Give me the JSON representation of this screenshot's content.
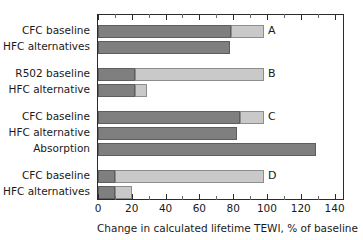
{
  "chart_data": {
    "type": "bar",
    "orientation": "horizontal",
    "title": "",
    "xlabel": "Change in calculated lifetime TEWI, % of baseline",
    "ylabel": "",
    "xlim": [
      0,
      145
    ],
    "xticks": [
      0,
      20,
      40,
      60,
      80,
      100,
      120,
      140
    ],
    "xtick_labels": [
      "0",
      "20",
      "40",
      "60",
      "80",
      "100",
      "120",
      "140"
    ],
    "minor_tick_step": 10,
    "grid": false,
    "legend": null,
    "stacked": true,
    "segment_names": [
      "direct",
      "indirect"
    ],
    "segment_colors": [
      "#7f7f7f",
      "#c9c9c9"
    ],
    "panels": [
      {
        "letter": "A",
        "bars": [
          {
            "label": "CFC baseline",
            "values": [
              79,
              19
            ],
            "total": 98
          },
          {
            "label": "HFC alternatives",
            "values": [
              78,
              0
            ],
            "total": 78
          }
        ]
      },
      {
        "letter": "B",
        "bars": [
          {
            "label": "R502 baseline",
            "values": [
              22,
              76
            ],
            "total": 98
          },
          {
            "label": "HFC alternative",
            "values": [
              22,
              7
            ],
            "total": 29
          }
        ]
      },
      {
        "letter": "C",
        "bars": [
          {
            "label": "CFC baseline",
            "values": [
              84,
              14
            ],
            "total": 98
          },
          {
            "label": "HFC alternative",
            "values": [
              82,
              0
            ],
            "total": 82
          },
          {
            "label": "Absorption",
            "values": [
              129,
              0
            ],
            "total": 129
          }
        ]
      },
      {
        "letter": "D",
        "bars": [
          {
            "label": "CFC baseline",
            "values": [
              10,
              88
            ],
            "total": 98
          },
          {
            "label": "HFC alternatives",
            "values": [
              10,
              10
            ],
            "total": 20
          }
        ]
      }
    ]
  },
  "axis": {
    "title": "Change in calculated lifetime TEWI, % of baseline",
    "tick_labels": [
      "0",
      "20",
      "40",
      "60",
      "80",
      "100",
      "120",
      "140"
    ]
  },
  "labels": {
    "a1": "CFC baseline",
    "a2": "HFC alternatives",
    "b1": "R502 baseline",
    "b2": "HFC alternative",
    "c1": "CFC baseline",
    "c2": "HFC alternative",
    "c3": "Absorption",
    "d1": "CFC baseline",
    "d2": "HFC alternatives"
  },
  "panel_letters": {
    "a": "A",
    "b": "B",
    "c": "C",
    "d": "D"
  },
  "colors": {
    "dark_segment": "#7f7f7f",
    "light_segment": "#c9c9c9",
    "axis": "#2b2b2b",
    "text": "#1a1a1a",
    "background": "#ffffff"
  }
}
